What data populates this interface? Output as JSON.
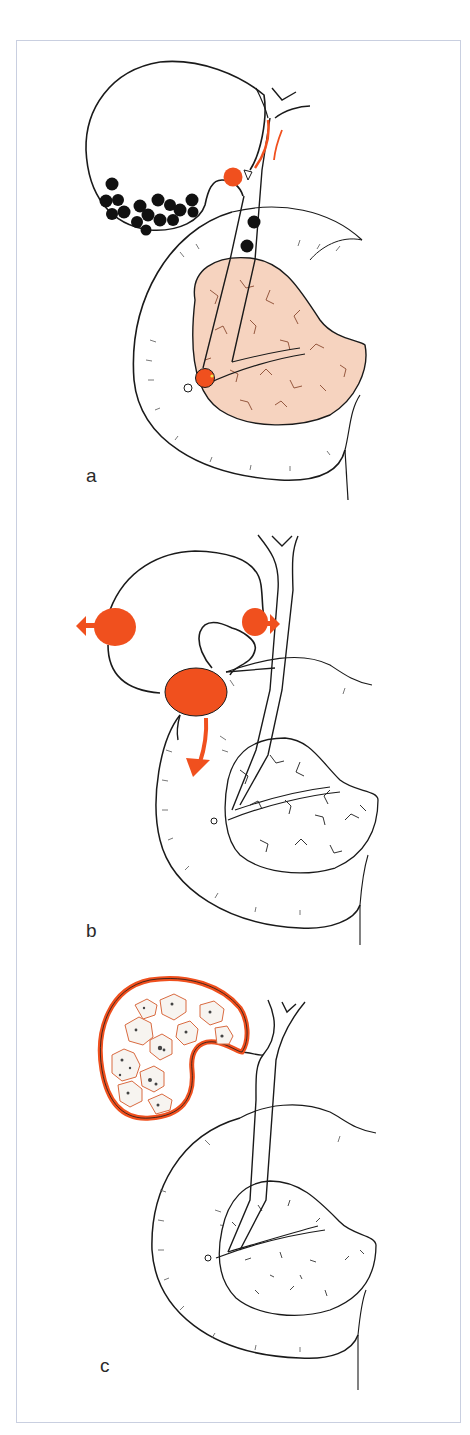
{
  "figure": {
    "panels": [
      {
        "id": "a",
        "label": "a",
        "description": "Gallbladder with multiple black stones; stone impacted at cystic duct neck; stones in common bile duct; stone impacted at papilla with inflamed (pink) pancreas"
      },
      {
        "id": "b",
        "label": "b",
        "description": "Gallbladder with orange inflammatory masses and arrows indicating perforation / fistula directions (left, right, downward to duodenum)"
      },
      {
        "id": "c",
        "label": "c",
        "description": "Gallbladder with thickened orange wall filled with irregular grey-white stones (porcelain / stone-packed gallbladder)"
      }
    ],
    "colors": {
      "line": "#1a1a1a",
      "accent_orange": "#f0501e",
      "pancreas_fill": "#f6d3bf",
      "pancreas_lobule": "#8a4a30",
      "frame_border": "#c9cfe0",
      "background": "#ffffff"
    }
  }
}
